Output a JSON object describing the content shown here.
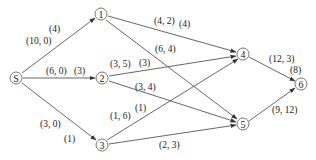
{
  "diagram": {
    "type": "network-flow-graph",
    "nodes": [
      {
        "id": "S",
        "label": "S",
        "x": 16,
        "y": 78
      },
      {
        "id": "1",
        "label": "1",
        "x": 101,
        "y": 14
      },
      {
        "id": "2",
        "label": "2",
        "x": 102,
        "y": 78
      },
      {
        "id": "3",
        "label": "3",
        "x": 102,
        "y": 145
      },
      {
        "id": "4",
        "label": "4",
        "x": 243,
        "y": 54
      },
      {
        "id": "5",
        "label": "5",
        "x": 243,
        "y": 124
      },
      {
        "id": "6",
        "label": "6",
        "x": 301,
        "y": 84
      }
    ],
    "edges": [
      {
        "from": "S",
        "to": "1",
        "pair": "(10, 0)",
        "flow": "(4)"
      },
      {
        "from": "S",
        "to": "2",
        "pair": "(6, 0)",
        "flow": "(3)"
      },
      {
        "from": "S",
        "to": "3",
        "pair": "(3, 0)",
        "flow": "(1)"
      },
      {
        "from": "1",
        "to": "4",
        "pair": "(4, 2)",
        "flow": "(4)"
      },
      {
        "from": "1",
        "to": "5",
        "pair": "(6, 4)",
        "flow": ""
      },
      {
        "from": "2",
        "to": "4",
        "pair": "(3, 5)",
        "flow": "(3)"
      },
      {
        "from": "2",
        "to": "5",
        "pair": "(3, 4)",
        "flow": ""
      },
      {
        "from": "3",
        "to": "4",
        "pair": "(1, 6)",
        "flow": "(1)"
      },
      {
        "from": "3",
        "to": "5",
        "pair": "(2, 3)",
        "flow": ""
      },
      {
        "from": "4",
        "to": "6",
        "pair": "(12, 3)",
        "flow": "(8)"
      },
      {
        "from": "5",
        "to": "6",
        "pair": "(9, 12)",
        "flow": ""
      }
    ]
  },
  "labels": {
    "s1_pair": "(10, 0)",
    "s1_flow": "(4)",
    "s2_pair": "(6, 0)",
    "s2_flow": "(3)",
    "s3_pair": "(3, 0)",
    "s3_flow": "(1)",
    "e14_pair": "(4, 2)",
    "e14_flow": "(4)",
    "e15_pair": "(6, 4)",
    "e24_pair": "(3, 5)",
    "e24_flow": "(3)",
    "e25_pair": "(3, 4)",
    "e34_pair": "(1, 6)",
    "e34_flow": "(1)",
    "e35_pair": "(2, 3)",
    "e46_pair": "(12, 3)",
    "e46_flow": "(8)",
    "e56_pair": "(9, 12)"
  },
  "node_labels": {
    "S": "S",
    "n1": "1",
    "n2": "2",
    "n3": "3",
    "n4": "4",
    "n5": "5",
    "n6": "6"
  },
  "colors": {
    "line": "#444444",
    "text": "#222222",
    "background": "#ffffff"
  }
}
